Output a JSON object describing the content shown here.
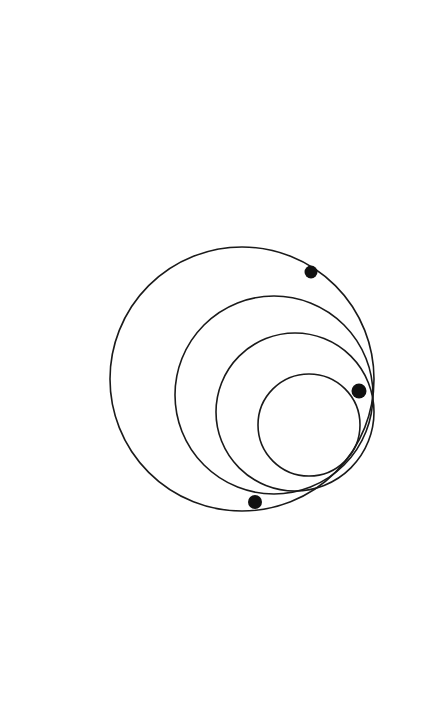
{
  "figure": {
    "kind": "line-drawing",
    "canvas": {
      "width": 430,
      "height": 718
    },
    "background_color": "#ffffff",
    "stroke_color": "#1a1a1a",
    "stroke_width": 1.6,
    "dot_color": "#111111",
    "circle_count": 4,
    "dot_count": 3
  },
  "chart_data": {
    "type": "scatter",
    "xlabel": "",
    "ylabel": "",
    "grid": false,
    "legend": "none",
    "xlim": [
      0,
      430
    ],
    "ylim": [
      0,
      718
    ],
    "circles": [
      {
        "name": "circle-outer",
        "cx": 242,
        "cy": 379,
        "r": 132
      },
      {
        "name": "circle-second",
        "cx": 274,
        "cy": 395,
        "r": 99
      },
      {
        "name": "circle-third",
        "cx": 295,
        "cy": 412,
        "r": 79
      },
      {
        "name": "circle-inner",
        "cx": 309,
        "cy": 425,
        "r": 51
      }
    ],
    "points": [
      {
        "name": "dot-upper-right",
        "x": 311,
        "y": 272,
        "r": 6.5
      },
      {
        "name": "dot-right",
        "x": 359,
        "y": 391,
        "r": 7.5
      },
      {
        "name": "dot-bottom",
        "x": 255,
        "y": 502,
        "r": 7.0
      }
    ]
  },
  "geometry": {
    "outer": {
      "left": 110,
      "right": 374,
      "top": 242,
      "bottom": 516
    },
    "second": {
      "left": 176,
      "right": 373,
      "top": 296,
      "bottom": 494
    },
    "third": {
      "left": 215,
      "right": 374,
      "top": 333,
      "bottom": 491
    },
    "inner": {
      "left": 259,
      "right": 360,
      "top": 372,
      "bottom": 478
    }
  }
}
